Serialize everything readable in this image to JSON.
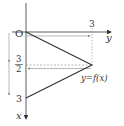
{
  "diagram": {
    "title": "",
    "function_label": "y=f(x)",
    "axes": {
      "horizontal": {
        "label": "y",
        "direction": "right"
      },
      "vertical": {
        "label": "x",
        "direction": "down"
      }
    },
    "origin_label": "O",
    "tick_labels": {
      "y_three": "3",
      "x_three_half_num": "3",
      "x_three_half_den": "2",
      "x_three": "3"
    },
    "vertices": [
      {
        "x": 0,
        "y": 0
      },
      {
        "x": 1.5,
        "y": 3
      },
      {
        "x": 3,
        "y": 0
      }
    ],
    "colors": {
      "axis": "#333333",
      "graph": "#333333",
      "guide": "#888888"
    }
  }
}
